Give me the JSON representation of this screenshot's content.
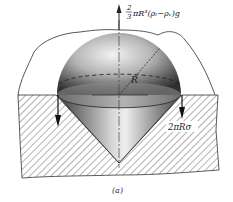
{
  "figure": {
    "caption": "(a)",
    "labels": {
      "buoyancy_force_frac_num": "2",
      "buoyancy_force_frac_den": "3",
      "buoyancy_force_expr": "πR³(ρₗ−ρᵥ)g",
      "surface_tension_force": "2πRσ",
      "radius": "R"
    },
    "colors": {
      "ink": "#222222",
      "sphere_light": "#e8e8e8",
      "sphere_dark": "#3a3a3a",
      "hatch": "#555555",
      "background": "#ffffff"
    }
  }
}
